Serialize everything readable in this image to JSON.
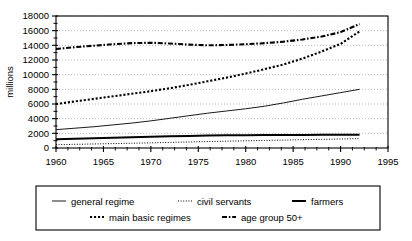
{
  "chart_data": {
    "type": "line",
    "title": "",
    "xlabel": "",
    "ylabel": "millions",
    "xlim": [
      1960,
      1995
    ],
    "ylim": [
      0,
      18000
    ],
    "grid": "horizontal-dotted",
    "legend_position": "below-boxed",
    "x_ticks": [
      "1960",
      "1965",
      "1970",
      "1975",
      "1980",
      "1985",
      "1990",
      "1995"
    ],
    "x_tick_values": [
      1960,
      1965,
      1970,
      1975,
      1980,
      1985,
      1990,
      1995
    ],
    "y_ticks": [
      "0",
      "2000",
      "4000",
      "6000",
      "8000",
      "10000",
      "12000",
      "14000",
      "16000",
      "18000"
    ],
    "y_tick_values": [
      0,
      2000,
      4000,
      6000,
      8000,
      10000,
      12000,
      14000,
      16000,
      18000
    ],
    "x": [
      1960,
      1962,
      1964,
      1966,
      1968,
      1970,
      1972,
      1974,
      1976,
      1978,
      1980,
      1982,
      1984,
      1986,
      1988,
      1990,
      1992
    ],
    "series": [
      {
        "name": "general regime",
        "style": "solid-thin",
        "values": [
          2500,
          2700,
          2900,
          3150,
          3400,
          3700,
          4050,
          4400,
          4750,
          5050,
          5350,
          5700,
          6150,
          6650,
          7100,
          7550,
          8000
        ]
      },
      {
        "name": "civil servants",
        "style": "fine-dotted",
        "values": [
          450,
          500,
          550,
          600,
          650,
          700,
          760,
          820,
          880,
          930,
          980,
          1030,
          1080,
          1130,
          1180,
          1230,
          1280
        ]
      },
      {
        "name": "farmers",
        "style": "solid-thick",
        "values": [
          1200,
          1260,
          1320,
          1390,
          1450,
          1520,
          1590,
          1650,
          1700,
          1730,
          1750,
          1760,
          1770,
          1780,
          1790,
          1800,
          1810
        ]
      },
      {
        "name": "main basic regimes",
        "style": "coarse-dotted",
        "values": [
          6000,
          6350,
          6700,
          7050,
          7400,
          7750,
          8150,
          8600,
          9100,
          9600,
          10150,
          10750,
          11400,
          12200,
          13150,
          14200,
          15900
        ]
      },
      {
        "name": "age group 50+",
        "style": "dash-dot",
        "values": [
          13500,
          13750,
          13950,
          14150,
          14300,
          14350,
          14250,
          14100,
          14000,
          14050,
          14150,
          14300,
          14500,
          14800,
          15200,
          15800,
          16900
        ]
      }
    ]
  },
  "legend": {
    "row1": [
      {
        "label": "general regime",
        "marker": "solid-thin"
      },
      {
        "label": "civil servants",
        "marker": "fine-dotted"
      },
      {
        "label": "farmers",
        "marker": "solid-thick"
      }
    ],
    "row2": [
      {
        "label": "main basic regimes",
        "marker": "coarse-dotted"
      },
      {
        "label": "age group 50+",
        "marker": "dash-dot"
      }
    ]
  },
  "colors": {
    "line": "#000000",
    "grid": "#999999",
    "frame": "#000000",
    "background": "#ffffff"
  }
}
